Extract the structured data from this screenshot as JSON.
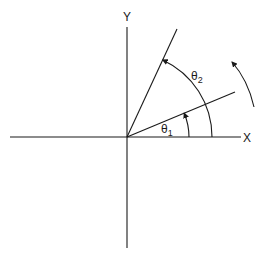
{
  "diagram": {
    "axes": {
      "x_label": "X",
      "y_label": "Y"
    },
    "angles": [
      {
        "symbol": "θ",
        "subscript": "1"
      },
      {
        "symbol": "θ",
        "subscript": "2"
      }
    ],
    "rotation_direction": "counterclockwise",
    "colors": {
      "ink": "#1a1a1a",
      "background": "#ffffff"
    }
  }
}
